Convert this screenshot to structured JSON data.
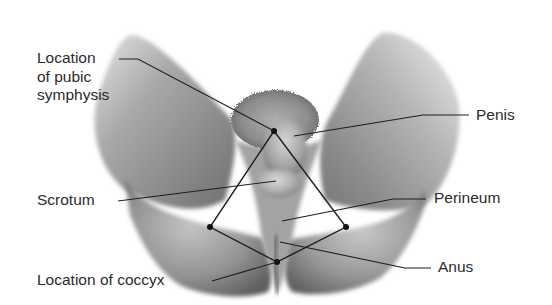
{
  "figure": {
    "line_color": "#1e1e1e",
    "text_color": "#2b2b2b",
    "background": "#ffffff"
  },
  "labels": {
    "pubic_symphysis": {
      "lines": [
        "Location",
        "of pubic",
        "symphysis"
      ],
      "side": "left"
    },
    "penis": {
      "text": "Penis",
      "side": "right"
    },
    "scrotum": {
      "text": "Scrotum",
      "side": "left"
    },
    "perineum": {
      "text": "Perineum",
      "side": "right"
    },
    "anus": {
      "text": "Anus",
      "side": "right"
    },
    "coccyx": {
      "text": "Location of coccyx",
      "side": "left"
    }
  },
  "landmarks": {
    "pubic_symphysis_point": [
      274,
      131
    ],
    "left_ischial_point": [
      210,
      227
    ],
    "right_ischial_point": [
      346,
      227
    ],
    "coccyx_point": [
      277,
      262
    ]
  }
}
